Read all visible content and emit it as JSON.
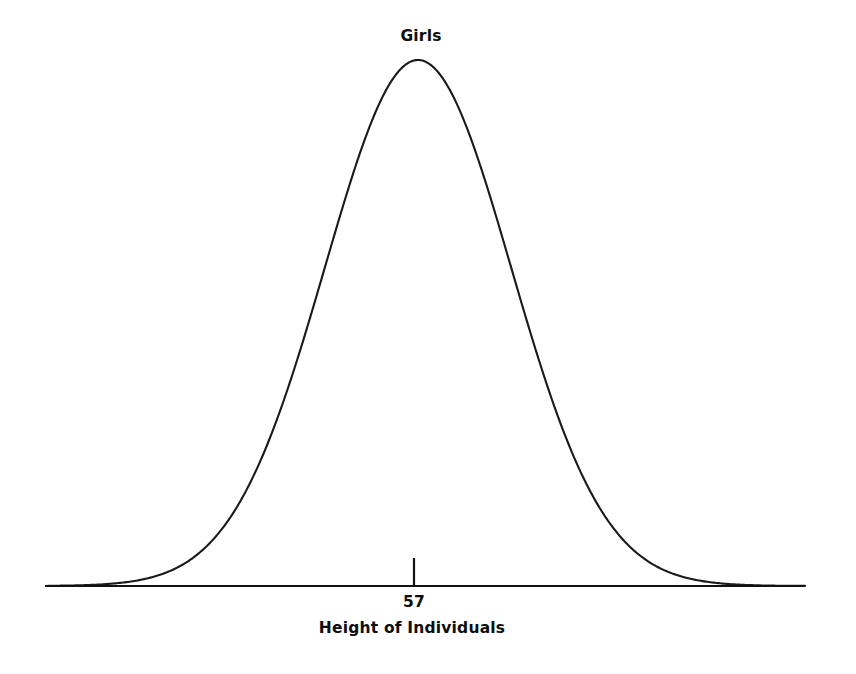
{
  "chart_data": {
    "type": "line",
    "title": "Girls",
    "xlabel": "Height of Individuals",
    "ylabel": "",
    "grid": false,
    "legend": null,
    "annotations": [
      {
        "name": "mean-tick",
        "label": "57",
        "x_value": 57,
        "description": "tick mark on the horizontal axis at the center of the distribution"
      }
    ],
    "distribution": {
      "shape": "normal",
      "mean": 57,
      "peak_label": "Girls",
      "symmetric": true
    },
    "x": [
      -3,
      -2.75,
      -2.5,
      -2.25,
      -2,
      -1.75,
      -1.5,
      -1.25,
      -1,
      -0.75,
      -0.5,
      -0.25,
      0,
      0.25,
      0.5,
      0.75,
      1,
      1.25,
      1.5,
      1.75,
      2,
      2.25,
      2.5,
      2.75,
      3
    ],
    "values": [
      0.011,
      0.023,
      0.044,
      0.079,
      0.135,
      0.216,
      0.325,
      0.458,
      0.607,
      0.755,
      0.882,
      0.969,
      1.0,
      0.969,
      0.882,
      0.755,
      0.607,
      0.458,
      0.325,
      0.216,
      0.135,
      0.079,
      0.044,
      0.023,
      0.011
    ],
    "xlim": [
      -3,
      3
    ],
    "ylim": [
      0,
      1
    ],
    "axis": {
      "x_axis_visible": true,
      "y_axis_visible": false
    }
  },
  "style": {
    "background": "#ffffff",
    "curve_color": "#1a1a1a",
    "axis_color": "#111111",
    "text_color": "#0d0d0d"
  },
  "geometry": {
    "peak_x": 418,
    "peak_y": 60,
    "baseline_y": 586,
    "axis_x_start": 45,
    "axis_x_end": 805,
    "tick_x": 414,
    "tick_top": 558,
    "sigma_px": 93
  }
}
